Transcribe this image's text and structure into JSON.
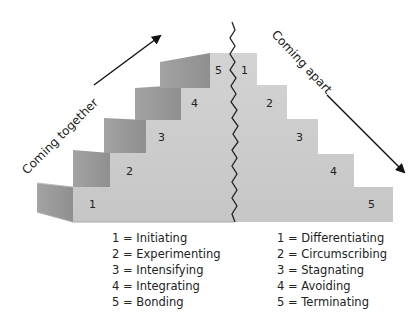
{
  "diagram": {
    "arrows": {
      "left_label": "Coming together",
      "right_label": "Coming apart"
    },
    "left_steps": [
      "1",
      "2",
      "3",
      "4",
      "5"
    ],
    "right_steps": [
      "1",
      "2",
      "3",
      "4",
      "5"
    ],
    "colors": {
      "front_face": "#cfcfcf",
      "side_face_dark": "#9c9c9c",
      "side_face_light": "#bdbdbd",
      "crack": "#222222",
      "arrow": "#111111"
    }
  },
  "legend": {
    "coming_together": [
      "1 = Initiating",
      "2 = Experimenting",
      "3 = Intensifying",
      "4 = Integrating",
      "5 = Bonding"
    ],
    "coming_apart": [
      "1 = Differentiating",
      "2 = Circumscribing",
      "3 = Stagnating",
      "4 = Avoiding",
      "5 = Terminating"
    ]
  }
}
